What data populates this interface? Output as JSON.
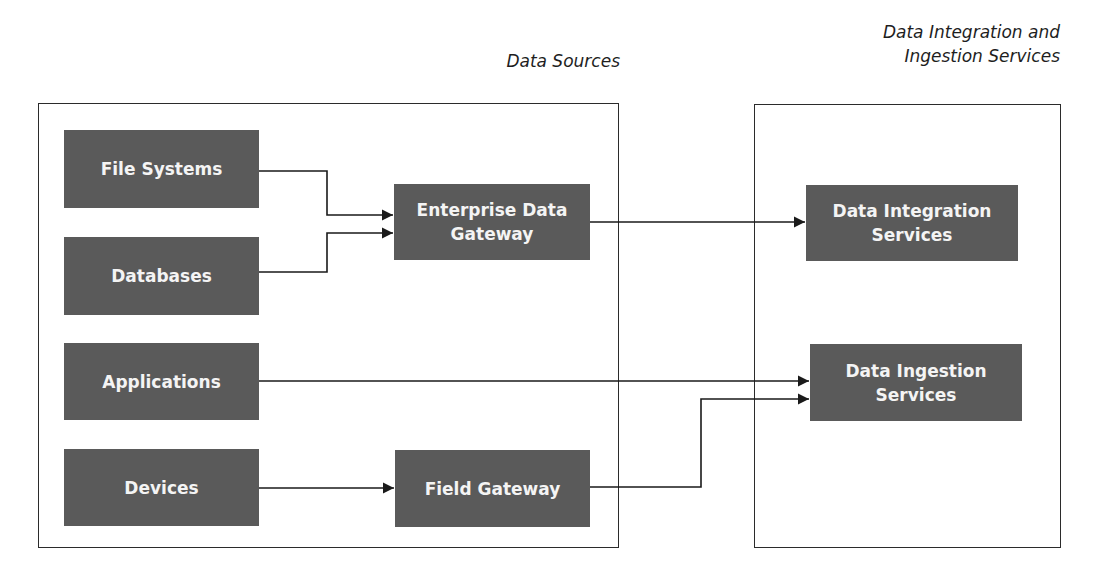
{
  "captions": {
    "data_sources": "Data Sources",
    "services_line1": "Data Integration and",
    "services_line2": "Ingestion Services"
  },
  "nodes": {
    "file_systems": "File Systems",
    "databases": "Databases",
    "applications": "Applications",
    "devices": "Devices",
    "enterprise_gateway_line1": "Enterprise Data",
    "enterprise_gateway_line2": "Gateway",
    "field_gateway": "Field Gateway",
    "integration_line1": "Data Integration",
    "integration_line2": "Services",
    "ingestion_line1": "Data Ingestion",
    "ingestion_line2": "Services"
  },
  "edges": [
    {
      "from": "File Systems",
      "to": "Enterprise Data Gateway"
    },
    {
      "from": "Databases",
      "to": "Enterprise Data Gateway"
    },
    {
      "from": "Enterprise Data Gateway",
      "to": "Data Integration Services"
    },
    {
      "from": "Applications",
      "to": "Data Ingestion Services"
    },
    {
      "from": "Devices",
      "to": "Field Gateway"
    },
    {
      "from": "Field Gateway",
      "to": "Data Ingestion Services"
    }
  ],
  "colors": {
    "node_fill": "#5a5a5a",
    "node_text": "#f4f4f4",
    "line": "#1a1a1a"
  }
}
